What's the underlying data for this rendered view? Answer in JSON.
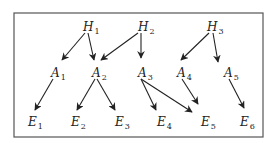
{
  "diagram": {
    "type": "directed-graph",
    "frame": {
      "x": 14,
      "y": 13,
      "width": 249,
      "height": 124,
      "color": "#555555"
    },
    "nodes": [
      {
        "id": "H1",
        "letter": "H",
        "sub": "1",
        "x": 88,
        "y": 27
      },
      {
        "id": "H2",
        "letter": "H",
        "sub": "2",
        "x": 143,
        "y": 27
      },
      {
        "id": "H3",
        "letter": "H",
        "sub": "3",
        "x": 212,
        "y": 27
      },
      {
        "id": "A1",
        "letter": "A",
        "sub": "1",
        "x": 56,
        "y": 73
      },
      {
        "id": "A2",
        "letter": "A",
        "sub": "2",
        "x": 97,
        "y": 73
      },
      {
        "id": "A3",
        "letter": "A",
        "sub": "3",
        "x": 143,
        "y": 73
      },
      {
        "id": "A4",
        "letter": "A",
        "sub": "4",
        "x": 182,
        "y": 73
      },
      {
        "id": "A5",
        "letter": "A",
        "sub": "5",
        "x": 229,
        "y": 73
      },
      {
        "id": "E1",
        "letter": "E",
        "sub": "1",
        "x": 33,
        "y": 122
      },
      {
        "id": "E2",
        "letter": "E",
        "sub": "2",
        "x": 76,
        "y": 122
      },
      {
        "id": "E3",
        "letter": "E",
        "sub": "3",
        "x": 120,
        "y": 122
      },
      {
        "id": "E4",
        "letter": "E",
        "sub": "4",
        "x": 162,
        "y": 122
      },
      {
        "id": "E5",
        "letter": "E",
        "sub": "5",
        "x": 206,
        "y": 122
      },
      {
        "id": "E6",
        "letter": "E",
        "sub": "6",
        "x": 245,
        "y": 122
      }
    ],
    "edges": [
      {
        "from": "H1",
        "to": "A1",
        "x1": 85,
        "y1": 33,
        "x2": 62,
        "y2": 60
      },
      {
        "from": "H1",
        "to": "A2",
        "x1": 88,
        "y1": 33,
        "x2": 94,
        "y2": 60
      },
      {
        "from": "H2",
        "to": "A2",
        "x1": 138,
        "y1": 33,
        "x2": 101,
        "y2": 60
      },
      {
        "from": "H2",
        "to": "A3",
        "x1": 141,
        "y1": 33,
        "x2": 141,
        "y2": 58
      },
      {
        "from": "H3",
        "to": "A4",
        "x1": 209,
        "y1": 33,
        "x2": 181,
        "y2": 60
      },
      {
        "from": "H3",
        "to": "A5",
        "x1": 213,
        "y1": 33,
        "x2": 218,
        "y2": 62,
        "note": "to A5"
      },
      {
        "from": "A1",
        "to": "E1",
        "x1": 53,
        "y1": 79,
        "x2": 35,
        "y2": 110
      },
      {
        "from": "A2",
        "to": "E2",
        "x1": 95,
        "y1": 79,
        "x2": 77,
        "y2": 110
      },
      {
        "from": "A2",
        "to": "E3",
        "x1": 97,
        "y1": 79,
        "x2": 115,
        "y2": 110
      },
      {
        "from": "A3",
        "to": "E4",
        "x1": 141,
        "y1": 79,
        "x2": 156,
        "y2": 110
      },
      {
        "from": "A3",
        "to": "E5",
        "x1": 141,
        "y1": 79,
        "x2": 192,
        "y2": 112
      },
      {
        "from": "A4",
        "to": "E5",
        "x1": 182,
        "y1": 79,
        "x2": 198,
        "y2": 104
      },
      {
        "from": "A5",
        "to": "E6",
        "x1": 229,
        "y1": 79,
        "x2": 244,
        "y2": 108
      }
    ]
  }
}
